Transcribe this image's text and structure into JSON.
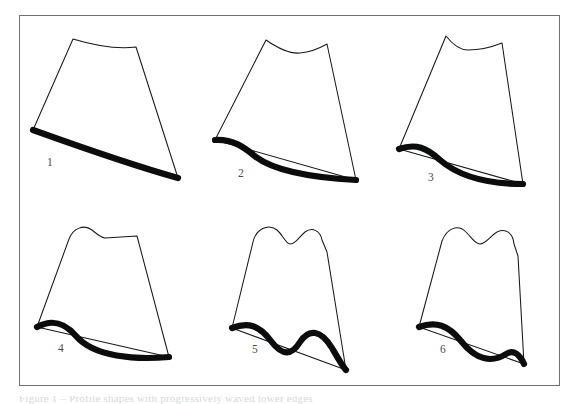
{
  "figure": {
    "title": "",
    "background_color": "#ffffff",
    "frame_color": "#6e7276",
    "outline_color": "#17191b",
    "edge_color": "#0b0c0d",
    "label_color": "#4a4d50",
    "caption_partial": "Figure 1 – Profile shapes with progressively waved lower edges",
    "panels": [
      {
        "id": "panel-1",
        "label": "1",
        "label_x": 47,
        "label_y": 166,
        "top_description": "smooth concave top edge",
        "bottom_description": "single smooth convex sweep",
        "outline_path": "M 73 39 C 96 46 120 49 136 47 L 178 178 L 33 130 Z",
        "edge_path": "M 33 130 C 72 144 128 164 178 178"
      },
      {
        "id": "panel-2",
        "label": "2",
        "label_x": 238,
        "label_y": 177,
        "top_description": "one shallow dip in the top edge",
        "bottom_description": "single S-wave on lower edge",
        "outline_path": "M 266 40 C 279 49 290 54 300 53 C 311 52 320 48 327 44 L 356 180 L 215 140 Z",
        "edge_path": "M 215 140 C 233 139 244 147 256 157 C 276 172 320 178 356 180"
      },
      {
        "id": "panel-3",
        "label": "3",
        "label_x": 428,
        "label_y": 181,
        "top_description": "rounded peak at left then dip across top",
        "bottom_description": "pronounced S-wave on lower edge",
        "outline_path": "M 446 36 C 453 45 460 50 468 50 C 480 50 492 47 502 43 L 523 184 L 399 149 Z",
        "edge_path": "M 399 149 C 416 143 427 148 440 160 C 462 179 496 184 523 184"
      },
      {
        "id": "panel-4",
        "label": "4",
        "label_x": 58,
        "label_y": 352,
        "top_description": "single rounded bump at left, flat top to the right",
        "bottom_description": "S-wave on lower edge",
        "outline_path": "M 69 239 C 73 228 84 224 92 230 C 97 234 100 237 105 238 L 137 236 L 169 357 L 37 327 Z",
        "edge_path": "M 37 327 C 52 319 64 322 76 336 C 94 357 135 360 169 357"
      },
      {
        "id": "panel-5",
        "label": "5",
        "label_x": 252,
        "label_y": 353,
        "top_description": "two rounded peaks with a notch between",
        "bottom_description": "double wave with two troughs on lower edge",
        "outline_path": "M 253 242 C 256 229 268 223 277 230 C 283 235 285 243 290 244 C 295 245 299 237 305 232 C 312 227 320 230 322 240 L 327 252 L 346 370 L 232 328 Z",
        "edge_path": "M 232 328 C 248 322 259 325 271 341 C 283 357 292 355 300 342 C 309 328 321 330 332 348 C 339 360 343 367 346 370"
      },
      {
        "id": "panel-6",
        "label": "6",
        "label_x": 440,
        "label_y": 353,
        "top_description": "two rounded peaks with a shallow notch",
        "bottom_description": "wave with single deep trough on lower edge",
        "outline_path": "M 442 241 C 447 228 458 224 466 232 C 472 238 475 244 480 244 C 486 244 490 236 497 232 C 506 228 513 233 514 244 L 518 256 L 524 364 L 419 327 Z",
        "edge_path": "M 419 327 C 436 321 448 325 461 341 C 476 360 492 363 506 354 C 514 349 520 355 524 364"
      }
    ]
  }
}
